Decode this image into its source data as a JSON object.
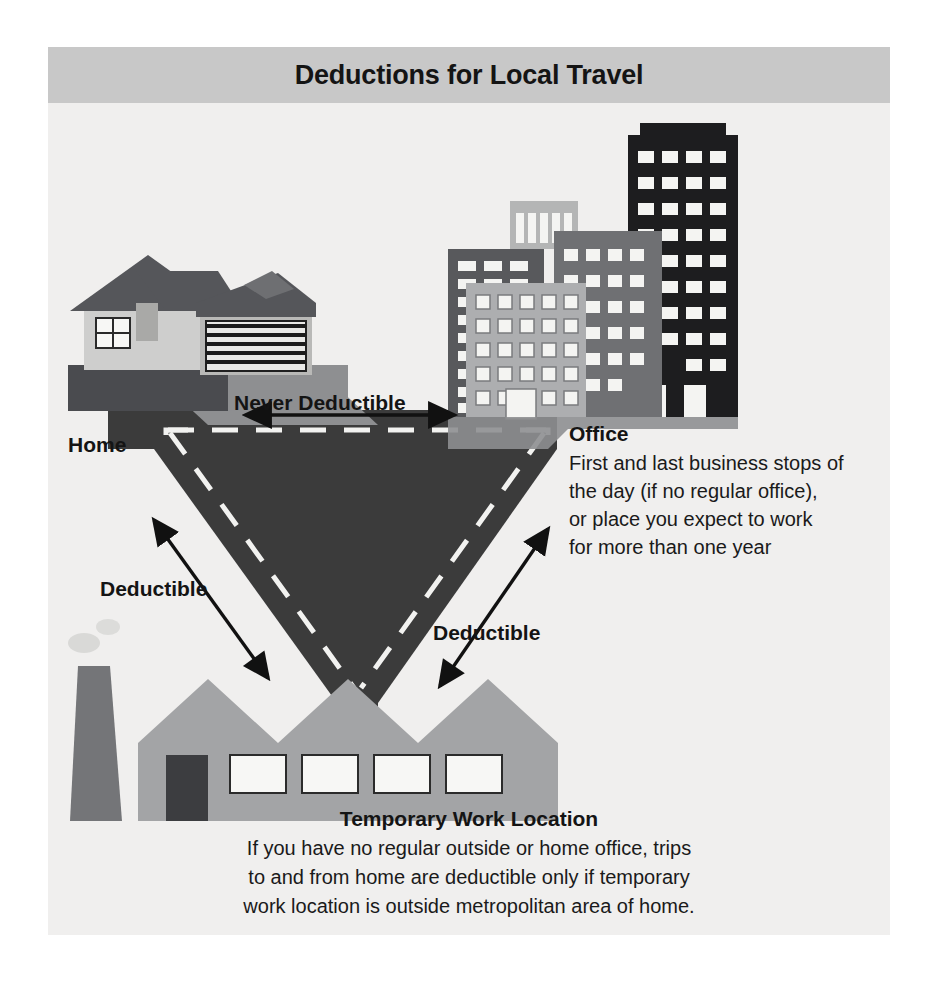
{
  "figure": {
    "title": "Deductions for Local Travel",
    "background_color": "#f0efee",
    "title_band_color": "#c8c8c8",
    "road_color": "#3b3b3b",
    "arrow_color": "#111111",
    "text_color": "#141414"
  },
  "labels": {
    "home": "Home",
    "never_deductible": "Never Deductible",
    "deductible_left": "Deductible",
    "deductible_right": "Deductible"
  },
  "office": {
    "heading": "Office",
    "lines": [
      "First and last business stops of",
      "the day (if no regular office),",
      "or place you expect to work",
      "for more than one year"
    ]
  },
  "temporary": {
    "heading": "Temporary Work Location",
    "lines": [
      "If you have no regular outside or home office, trips",
      "to and from home are deductible only if temporary",
      "work location is outside metropolitan area of home."
    ]
  },
  "icons": {
    "house": "house-icon",
    "garage": "garage-icon",
    "office_towers": "office-buildings-icon",
    "factory": "factory-icon",
    "chimney": "chimney-icon",
    "road_triangle": "road-triangle-icon",
    "arrow_horizontal": "double-arrow-horizontal-icon",
    "arrow_left_diagonal": "double-arrow-diagonal-left-icon",
    "arrow_right_diagonal": "double-arrow-diagonal-right-icon"
  },
  "palette": {
    "roof_dark": "#55565a",
    "house_wall": "#cfcfcf",
    "house_base": "#4a4b4f",
    "driveway": "#8e8f91",
    "tower_dark": "#1d1d1f",
    "tower_mid": "#6f7073",
    "tower_light": "#adaeb0",
    "tower_left": "#58595c",
    "factory_body": "#a3a4a6",
    "factory_chimney": "#747578",
    "window_white": "#f7f7f5"
  }
}
